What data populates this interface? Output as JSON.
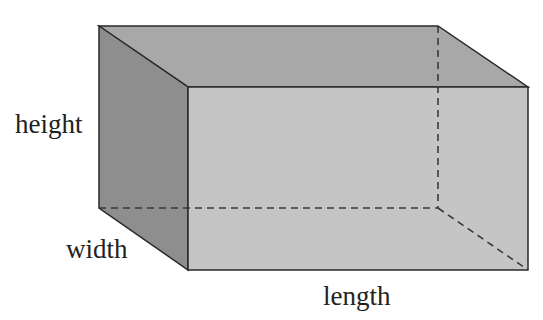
{
  "diagram": {
    "type": "rectangular-prism",
    "labels": {
      "height": "height",
      "width": "width",
      "length": "length"
    },
    "colors": {
      "left_face": "#8e8e8e",
      "top_face": "#a8a8a8",
      "front_face": "#c5c5c5",
      "edge": "#2a2a2a",
      "hidden_edge": "#3a3a3a",
      "text": "#222222"
    }
  }
}
